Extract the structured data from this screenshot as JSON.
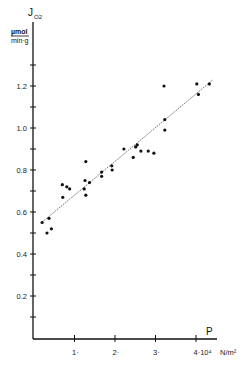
{
  "chart_data": {
    "type": "scatter",
    "title": "",
    "ylabel": "J_O2",
    "ylabel_main": "J",
    "ylabel_sub": "O2",
    "yunit_numerator": "µmol",
    "yunit_denominator": "min·g",
    "xlabel": "P",
    "xunit": "N/m²",
    "xlim": [
      0,
      4.9
    ],
    "ylim": [
      0,
      1.4
    ],
    "grid": false,
    "legend": null,
    "x_ticks": [
      {
        "value": 1,
        "label": "1·"
      },
      {
        "value": 2,
        "label": "2·"
      },
      {
        "value": 3,
        "label": "3·"
      },
      {
        "value": 4,
        "label": "4·10⁴"
      }
    ],
    "x_tick_multiplier": "10⁴",
    "y_ticks_labeled": [
      {
        "value": 0.2,
        "label": "0.2"
      },
      {
        "value": 0.4,
        "label": "0.4"
      },
      {
        "value": 0.6,
        "label": "0.6"
      },
      {
        "value": 0.8,
        "label": "0.8"
      },
      {
        "value": 1.0,
        "label": "1.0"
      },
      {
        "value": 1.2,
        "label": "1.2"
      }
    ],
    "y_ticks_minor": [
      0.1,
      0.3,
      0.5,
      0.7,
      0.9,
      1.1,
      1.3
    ],
    "series": [
      {
        "name": "measurements",
        "marker": "filled-circle",
        "points": [
          [
            0.2,
            0.55
          ],
          [
            0.37,
            0.57
          ],
          [
            0.32,
            0.5
          ],
          [
            0.43,
            0.52
          ],
          [
            0.7,
            0.73
          ],
          [
            0.71,
            0.67
          ],
          [
            0.81,
            0.72
          ],
          [
            0.88,
            0.71
          ],
          [
            1.28,
            0.84
          ],
          [
            1.26,
            0.75
          ],
          [
            1.24,
            0.71
          ],
          [
            1.28,
            0.68
          ],
          [
            1.37,
            0.74
          ],
          [
            1.67,
            0.79
          ],
          [
            1.67,
            0.77
          ],
          [
            1.92,
            0.82
          ],
          [
            1.93,
            0.8
          ],
          [
            2.22,
            0.9
          ],
          [
            2.45,
            0.86
          ],
          [
            2.51,
            0.91
          ],
          [
            2.55,
            0.92
          ],
          [
            2.64,
            0.89
          ],
          [
            2.82,
            0.89
          ],
          [
            2.96,
            0.88
          ],
          [
            3.21,
            1.2
          ],
          [
            3.23,
            1.04
          ],
          [
            3.23,
            0.99
          ],
          [
            4.02,
            1.21
          ],
          [
            4.06,
            1.16
          ],
          [
            4.33,
            1.21
          ]
        ]
      }
    ],
    "regression_line": {
      "style": "dashed",
      "from": [
        0.19,
        0.55
      ],
      "to": [
        4.42,
        1.23
      ]
    }
  }
}
